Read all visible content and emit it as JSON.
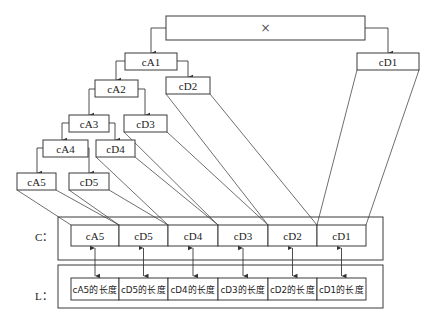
{
  "root": {
    "label": "×"
  },
  "tree": {
    "cA1": "cA1",
    "cD1": "cD1",
    "cA2": "cA2",
    "cD2": "cD2",
    "cA3": "cA3",
    "cD3": "cD3",
    "cA4": "cA4",
    "cD4": "cD4",
    "cA5": "cA5",
    "cD5": "cD5"
  },
  "c_vector": {
    "label": "C：",
    "cells": [
      "cA5",
      "cD5",
      "cD4",
      "cD3",
      "cD2",
      "cD1"
    ]
  },
  "l_vector": {
    "label": "L：",
    "cells": [
      "cA5的长度",
      "cD5的长度",
      "cD4的长度",
      "cD3的长度",
      "cD2的长度",
      "cD1的长度"
    ]
  }
}
